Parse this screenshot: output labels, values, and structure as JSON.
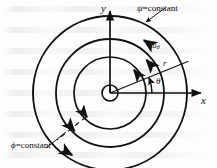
{
  "figure": {
    "kind": "vector-diagram",
    "colors": {
      "ink": "#111111",
      "paper": "#fdfdfd",
      "ghost": "#5a5a64"
    },
    "labels": {
      "y_axis": "y",
      "x_axis": "x",
      "radius": "r",
      "theta": "θ",
      "velocity": "u",
      "velocity_sub": "θ",
      "psi_constant": "ψ=constant",
      "psi_symbol": "ψ",
      "phi_constant": "ϕ=constant",
      "phi_symbol": "ϕ",
      "equals_constant": "=constant"
    },
    "geometry": {
      "center": {
        "x": 110,
        "y": 93
      },
      "circles": [
        {
          "name": "core-circle",
          "r": 8
        },
        {
          "name": "inner-streamline",
          "r": 36
        },
        {
          "name": "middle-streamline",
          "r": 54
        },
        {
          "name": "outer-streamline",
          "r": 77
        }
      ],
      "theta_degrees": 22,
      "axes": {
        "x_from": {
          "x": 110,
          "y": 93
        },
        "x_to": {
          "x": 205,
          "y": 93
        },
        "y_from": {
          "x": 110,
          "y": 93
        },
        "y_to": {
          "x": 110,
          "y": 8
        }
      }
    },
    "annotations": [
      {
        "name": "psi-leader",
        "text": "ψ=constant",
        "points_to": "outer-streamline"
      },
      {
        "name": "phi-leader",
        "text": "ϕ=constant",
        "points_to": "radial-dashed-line"
      },
      {
        "name": "velocity-arrow",
        "text": "uθ",
        "points_to": "middle-streamline"
      },
      {
        "name": "theta-arc",
        "text": "θ",
        "points_to": "angle-between-x-axis-and-radius"
      },
      {
        "name": "radius-line",
        "text": "r",
        "points_to": "outer-streamline"
      }
    ]
  }
}
